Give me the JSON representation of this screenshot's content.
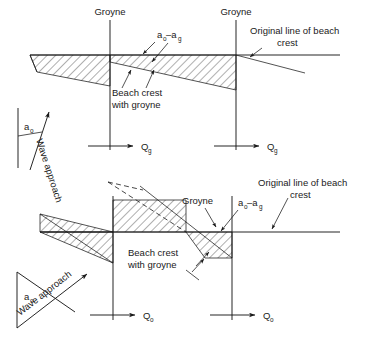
{
  "figure": {
    "title": "",
    "background": "#ffffff",
    "ink": "#1a1a1a"
  },
  "panels": [
    {
      "id": "top-panel",
      "name": "groyne-field-with-groyne-effect",
      "labels": {
        "groyne_left": "Groyne",
        "groyne_right": "Groyne",
        "original_line_1": "Original line of beach",
        "original_line_2": "crest",
        "angle_diff": "a",
        "angle_diff_sub1": "o",
        "angle_diff_dash": "–a",
        "angle_diff_sub2": "g",
        "beach_crest_1": "Beach crest",
        "beach_crest_2": "with groyne",
        "wave_approach": "Wave approach",
        "alpha": "a",
        "alpha_sub": "o",
        "transport_left": "Q",
        "transport_left_sub": "g",
        "transport_right": "Q",
        "transport_right_sub": "g"
      }
    },
    {
      "id": "bottom-panel",
      "name": "groyne-field-oblique-wave-approach",
      "labels": {
        "groyne": "Groyne",
        "original_line_1": "Original line of beach",
        "original_line_2": "crest",
        "angle_diff": "a",
        "angle_diff_sub1": "o",
        "angle_diff_dash": "–a",
        "angle_diff_sub2": "g",
        "beach_crest_1": "Beach crest",
        "beach_crest_2": "with groyne",
        "wave_approach": "Wave approach",
        "alpha": "a",
        "alpha_sub": "o",
        "transport_left": "Q",
        "transport_left_sub": "o",
        "transport_right": "Q",
        "transport_right_sub": "o"
      }
    }
  ]
}
